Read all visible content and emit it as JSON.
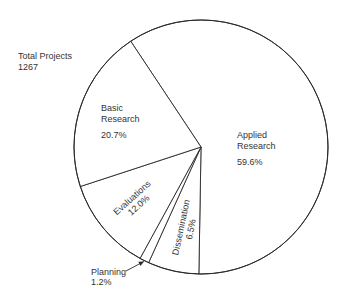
{
  "chart_data": {
    "type": "pie",
    "title": "",
    "total_label": "Total Projects",
    "total_value": "1267",
    "start_angle_deg": -33.6,
    "direction": "clockwise",
    "slices": [
      {
        "name": "Applied Research",
        "label_lines": [
          "Applied",
          "Research"
        ],
        "value": 59.6,
        "value_label": "59.6%"
      },
      {
        "name": "Dissemination",
        "label_lines": [
          "Dissemination"
        ],
        "value": 6.5,
        "value_label": "6.5%"
      },
      {
        "name": "Planning",
        "label_lines": [
          "Planning"
        ],
        "value": 1.2,
        "value_label": "1.2%"
      },
      {
        "name": "Evaluations",
        "label_lines": [
          "Evaluations"
        ],
        "value": 12.0,
        "value_label": "12.0%"
      },
      {
        "name": "Basic Research",
        "label_lines": [
          "Basic",
          "Research"
        ],
        "value": 20.7,
        "value_label": "20.7%"
      }
    ],
    "colors": {
      "stroke": "#2a2a2a",
      "fill": "#ffffff",
      "text": "#333333"
    },
    "legend": "none"
  }
}
